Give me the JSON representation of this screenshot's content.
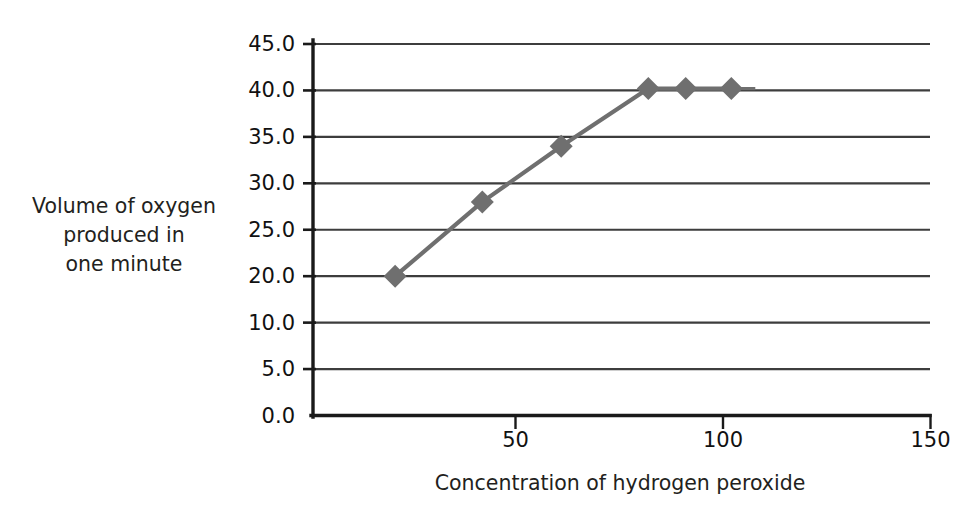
{
  "chart_data": {
    "type": "line",
    "title": "",
    "subtitle": "",
    "xlabel": "Concentration of hydrogen peroxide",
    "ylabel": "Volume of oxygen produced in one minute",
    "ylabel_lines": [
      "Volume of oxygen",
      "produced in",
      "one minute"
    ],
    "grid": "horizontal",
    "legend": "none",
    "xlim": [
      0,
      150
    ],
    "ylim": [
      0,
      45
    ],
    "xticks": [
      50,
      100,
      150
    ],
    "xtick_labels": [
      "50",
      "100",
      "150"
    ],
    "yticks": [
      0,
      5,
      10,
      20,
      25,
      30,
      35,
      40,
      45
    ],
    "ytick_labels": [
      "0.0",
      "5.0",
      "10.0",
      "20.0",
      "25.0",
      "30.0",
      "35.0",
      "40.0",
      "45.0"
    ],
    "gridline_values": [
      45,
      40,
      35,
      30,
      25,
      20,
      10,
      5,
      0
    ],
    "series": [
      {
        "name": "Volume of oxygen produced in one minute",
        "marker": "diamond",
        "color": "#6f6f6f",
        "x": [
          21,
          42,
          61,
          82,
          91,
          102
        ],
        "y": [
          20.0,
          28.0,
          34.0,
          40.2,
          40.2,
          40.2
        ]
      }
    ],
    "colors": {
      "line": "#6f6f6f",
      "marker": "#6f6f6f",
      "axis": "#1a1a1a",
      "gridline": "#3d3d3d",
      "background": "#ffffff",
      "text": "#231f20"
    }
  }
}
